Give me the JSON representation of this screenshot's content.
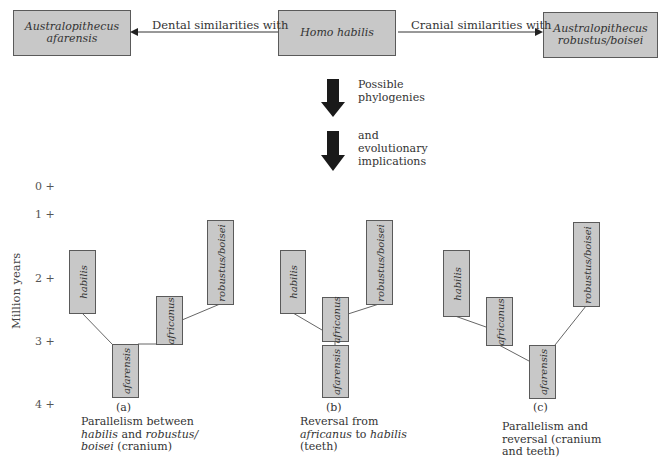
{
  "header": {
    "left_box": {
      "line1": "Australopithecus",
      "line2": "afarensis"
    },
    "center_box": {
      "label": "Homo habilis"
    },
    "right_box": {
      "line1": "Australopithecus",
      "line2": "robustus/boisei"
    },
    "left_relation": "Dental similarities with",
    "right_relation": "Cranial similarities with"
  },
  "flow": {
    "arrow1_note": {
      "line1": "Possible",
      "line2": "phylogenies"
    },
    "arrow2_note": {
      "line1": "and",
      "line2": "evolutionary",
      "line3": "implications"
    }
  },
  "axis": {
    "label": "Million years",
    "ticks": [
      "0 +",
      "1 +",
      "2 +",
      "3 +",
      "4 +"
    ]
  },
  "panels": [
    {
      "id": "(a)",
      "species": [
        "habilis",
        "afarensis",
        "africanus",
        "robustus/boisei"
      ],
      "caption": {
        "line1": "Parallelism between",
        "l2_a": "habilis",
        "l2_b": " and ",
        "l2_c": "robustus/",
        "l3_a": "boisei",
        "l3_b": " (cranium)"
      }
    },
    {
      "id": "(b)",
      "species": [
        "habilis",
        "africanus",
        "afarensis",
        "robustus/boisei"
      ],
      "caption": {
        "line1": "Reversal from",
        "l2_a": "africanus",
        "l2_b": " to ",
        "l2_c": "habilis",
        "line3": "(teeth)"
      }
    },
    {
      "id": "(c)",
      "species": [
        "habilis",
        "africanus",
        "afarensis",
        "robustus/boisei"
      ],
      "caption": {
        "line1": "Parallelism and",
        "line2": "reversal (cranium",
        "line3": "and teeth)"
      }
    }
  ],
  "colors": {
    "box_fill": "#c8c8c8",
    "box_border": "#5a5a5a",
    "arrow": "#1a1a1a",
    "line": "#555555"
  }
}
